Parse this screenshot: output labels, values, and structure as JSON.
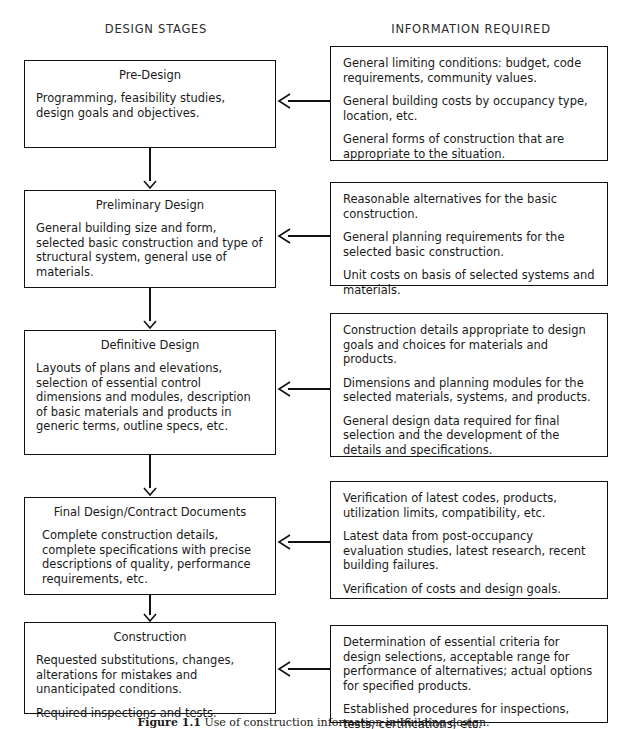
{
  "headers": {
    "left": "DESIGN STAGES",
    "right": "INFORMATION REQUIRED"
  },
  "colors": {
    "line": "#111111",
    "box_border": "#111111",
    "background": "#ffffff",
    "text": "#1a1a1a",
    "shadow": "#9a9a9a"
  },
  "stages": [
    {
      "title": "Pre-Design",
      "body": [
        "Programming, feasibility studies, design goals and objectives."
      ]
    },
    {
      "title": "Preliminary Design",
      "body": [
        "General building size and form, selected basic construction and type of structural system, general use of materials."
      ]
    },
    {
      "title": "Definitive Design",
      "body": [
        "Layouts of plans and elevations, selection of essential control dimensions and modules, description of basic materials and products in generic terms, outline specs, etc."
      ]
    },
    {
      "title": "Final Design/Contract Documents",
      "body": [
        "Complete construction details, complete specifications with precise descriptions of quality, performance requirements, etc."
      ]
    },
    {
      "title": "Construction",
      "body": [
        "Requested substitutions, changes, alterations for mistakes and unanticipated conditions.",
        "Required inspections and tests."
      ]
    }
  ],
  "information": [
    {
      "paragraphs": [
        "General limiting conditions: budget, code requirements, community values.",
        "General building costs by occupancy type, location, etc.",
        "General forms of construction that are appropriate to the situation."
      ]
    },
    {
      "paragraphs": [
        "Reasonable alternatives for the basic construction.",
        "General planning requirements for the selected basic construction.",
        "Unit costs on basis of selected systems and materials."
      ]
    },
    {
      "paragraphs": [
        "Construction details appropriate to design goals and choices for materials and products.",
        "Dimensions and planning modules for the selected materials, systems, and products.",
        "General design data required for final selection and the development of the details and specifications."
      ]
    },
    {
      "paragraphs": [
        "Verification of latest codes, products, utilization limits, compatibility, etc.",
        "Latest data from post-occupancy evaluation studies, latest research, recent building failures.",
        "Verification of costs and design goals."
      ]
    },
    {
      "paragraphs": [
        "Determination of essential criteria for design selections, acceptable range for performance of alternatives; actual options for specified products.",
        "Established procedures for inspections, tests, certifications, etc."
      ]
    }
  ],
  "caption": {
    "number": "Figure 1.1",
    "text": "Use of construction information in building design."
  }
}
